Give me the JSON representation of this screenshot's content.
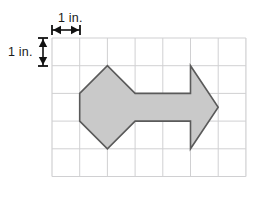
{
  "figure": {
    "type": "geometry-grid-figure",
    "grid": {
      "columns": 7,
      "rows": 5,
      "cell_size_label": "1 in.",
      "origin_px": [
        52,
        38
      ],
      "cell_px": 27.7,
      "line_color": "#d0d0d2",
      "border_color": "#d0d0d2"
    },
    "dimensions": {
      "horizontal_label": "1 in.",
      "vertical_label": "1 in."
    },
    "shape": {
      "fill_color": "#c9c9c9",
      "stroke_color": "#5a5a5a",
      "stroke_width": 1.6,
      "vertices_grid": [
        [
          1.0,
          2.0
        ],
        [
          2.0,
          1.0
        ],
        [
          3.0,
          2.0
        ],
        [
          5.0,
          2.0
        ],
        [
          5.0,
          1.0
        ],
        [
          6.0,
          2.5
        ],
        [
          5.0,
          4.0
        ],
        [
          5.0,
          3.0
        ],
        [
          3.0,
          3.0
        ],
        [
          2.0,
          4.0
        ],
        [
          1.0,
          3.0
        ]
      ]
    },
    "markers": {
      "horizontal_arrow": {
        "y_px": 30,
        "x_start_px": 52,
        "x_end_px": 80,
        "color": "#111111"
      },
      "vertical_arrow": {
        "x_px": 43,
        "y_start_px": 38,
        "y_end_px": 66,
        "color": "#111111"
      }
    }
  }
}
